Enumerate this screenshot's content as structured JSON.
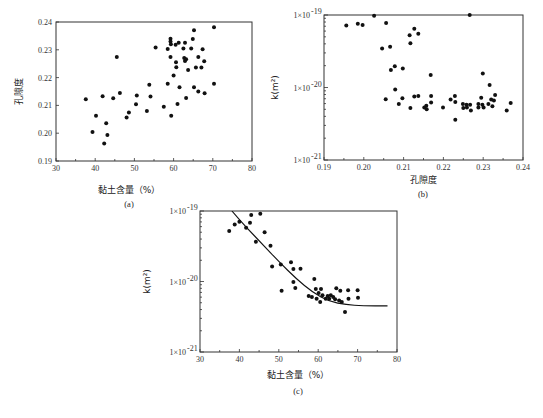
{
  "chart_data": [
    {
      "id": "a",
      "type": "scatter",
      "panel_label": "(a)",
      "title": "",
      "xlabel": "黏土含量（%）",
      "ylabel": "孔隙度",
      "xlim": [
        30,
        80
      ],
      "ylim": [
        0.19,
        0.24
      ],
      "yscale": "linear",
      "xticks": [
        30,
        40,
        50,
        60,
        70,
        80
      ],
      "xtick_labels": [
        "30",
        "40",
        "50",
        "60",
        "70",
        "80"
      ],
      "yticks": [
        0.19,
        0.2,
        0.21,
        0.22,
        0.23,
        0.24
      ],
      "ytick_labels": [
        "0.19",
        "0.20",
        "0.21",
        "0.22",
        "0.23",
        "0.24"
      ],
      "grid": false,
      "points": [
        [
          37.6,
          0.2122
        ],
        [
          39.3,
          0.2004
        ],
        [
          40.2,
          0.2063
        ],
        [
          41.9,
          0.2133
        ],
        [
          42.3,
          0.1963
        ],
        [
          42.8,
          0.2036
        ],
        [
          43.1,
          0.1994
        ],
        [
          44.6,
          0.2126
        ],
        [
          45.5,
          0.2274
        ],
        [
          46.3,
          0.2145
        ],
        [
          48.0,
          0.2057
        ],
        [
          48.6,
          0.2075
        ],
        [
          50.4,
          0.2104
        ],
        [
          50.6,
          0.2136
        ],
        [
          53.2,
          0.208
        ],
        [
          53.8,
          0.2174
        ],
        [
          54.1,
          0.2132
        ],
        [
          55.4,
          0.2308
        ],
        [
          57.5,
          0.2095
        ],
        [
          58.5,
          0.2178
        ],
        [
          58.5,
          0.2303
        ],
        [
          59.2,
          0.234
        ],
        [
          59.2,
          0.233
        ],
        [
          59.3,
          0.232
        ],
        [
          59.2,
          0.2274
        ],
        [
          59.4,
          0.2063
        ],
        [
          60.0,
          0.2208
        ],
        [
          60.5,
          0.2318
        ],
        [
          60.6,
          0.2255
        ],
        [
          60.7,
          0.2237
        ],
        [
          61.0,
          0.2105
        ],
        [
          61.3,
          0.2325
        ],
        [
          61.5,
          0.2165
        ],
        [
          62.5,
          0.2305
        ],
        [
          62.7,
          0.227
        ],
        [
          62.9,
          0.2325
        ],
        [
          62.9,
          0.226
        ],
        [
          63.2,
          0.2266
        ],
        [
          63.2,
          0.2127
        ],
        [
          63.7,
          0.2227
        ],
        [
          64.5,
          0.2305
        ],
        [
          64.9,
          0.2339
        ],
        [
          65.2,
          0.237
        ],
        [
          65.2,
          0.2165
        ],
        [
          65.7,
          0.2236
        ],
        [
          66.3,
          0.2274
        ],
        [
          66.3,
          0.215
        ],
        [
          67.1,
          0.2236
        ],
        [
          67.4,
          0.2302
        ],
        [
          67.8,
          0.2259
        ],
        [
          67.9,
          0.2144
        ],
        [
          70.3,
          0.2381
        ],
        [
          70.3,
          0.2178
        ]
      ]
    },
    {
      "id": "b",
      "type": "scatter",
      "panel_label": "(b)",
      "title": "",
      "xlabel": "孔隙度",
      "ylabel": "k(m²)",
      "xlim": [
        0.19,
        0.24
      ],
      "ylim": [
        1e-21,
        1e-19
      ],
      "yscale": "log",
      "xticks": [
        0.19,
        0.2,
        0.21,
        0.22,
        0.23,
        0.24
      ],
      "xtick_labels": [
        "0.19",
        "0.20",
        "0.21",
        "0.22",
        "0.23",
        "0.24"
      ],
      "yticks": [
        1e-21,
        1e-20,
        1e-19
      ],
      "ytick_labels": [
        [
          "1×10",
          "-21"
        ],
        [
          "1×10",
          "-20"
        ],
        [
          "1×10",
          "-19"
        ]
      ],
      "grid": false,
      "points": [
        [
          0.1956,
          7.16e-20
        ],
        [
          0.1985,
          7.59e-20
        ],
        [
          0.1997,
          7.25e-20
        ],
        [
          0.2026,
          9.77e-20
        ],
        [
          0.2056,
          7.77e-20
        ],
        [
          0.2046,
          3.44e-20
        ],
        [
          0.2066,
          3.64e-20
        ],
        [
          0.2068,
          1.75e-20
        ],
        [
          0.2078,
          1.96e-20
        ],
        [
          0.2098,
          1.83e-20
        ],
        [
          0.2055,
          6.9e-21
        ],
        [
          0.2079,
          9.4e-21
        ],
        [
          0.2088,
          5.9e-21
        ],
        [
          0.2097,
          7.1e-21
        ],
        [
          0.2115,
          5.26e-20
        ],
        [
          0.2117,
          4.09e-20
        ],
        [
          0.2127,
          6.46e-20
        ],
        [
          0.2137,
          5.51e-20
        ],
        [
          0.2117,
          5.2e-21
        ],
        [
          0.2127,
          7.5e-21
        ],
        [
          0.2137,
          7.6e-21
        ],
        [
          0.2152,
          5.3e-21
        ],
        [
          0.2157,
          5.6e-21
        ],
        [
          0.2158,
          5e-21
        ],
        [
          0.2168,
          1.49e-20
        ],
        [
          0.2169,
          7.6e-21
        ],
        [
          0.2169,
          6.2e-21
        ],
        [
          0.2199,
          5.3e-21
        ],
        [
          0.2218,
          6.8e-21
        ],
        [
          0.2229,
          7.6e-21
        ],
        [
          0.223,
          6.3e-21
        ],
        [
          0.223,
          3.6e-21
        ],
        [
          0.2249,
          5.9e-21
        ],
        [
          0.225,
          5.2e-21
        ],
        [
          0.2258,
          5.8e-21
        ],
        [
          0.2259,
          5.3e-21
        ],
        [
          0.2266,
          1e-19
        ],
        [
          0.2267,
          5.8e-21
        ],
        [
          0.2269,
          4.8e-21
        ],
        [
          0.2288,
          5.9e-21
        ],
        [
          0.2288,
          5.3e-21
        ],
        [
          0.2295,
          7.2e-21
        ],
        [
          0.2298,
          5.8e-21
        ],
        [
          0.2299,
          1.56e-20
        ],
        [
          0.2301,
          5.3e-21
        ],
        [
          0.2313,
          5.9e-21
        ],
        [
          0.2316,
          1.08e-20
        ],
        [
          0.232,
          6.8e-21
        ],
        [
          0.2323,
          5.5e-21
        ],
        [
          0.2327,
          6.6e-21
        ],
        [
          0.233,
          7.9e-21
        ],
        [
          0.2359,
          4.8e-21
        ],
        [
          0.2369,
          6.1e-21
        ]
      ]
    },
    {
      "id": "c",
      "type": "scatter",
      "panel_label": "(c)",
      "title": "",
      "xlabel": "黏土含量（%）",
      "ylabel": "k(m²)",
      "xlim": [
        30,
        80
      ],
      "ylim": [
        1e-21,
        1e-19
      ],
      "yscale": "log",
      "xticks": [
        30,
        40,
        50,
        60,
        70,
        80
      ],
      "xtick_labels": [
        "30",
        "40",
        "50",
        "60",
        "70",
        "80"
      ],
      "yticks": [
        1e-21,
        1e-20,
        1e-19
      ],
      "ytick_labels": [
        [
          "1×10",
          "-21"
        ],
        [
          "1×10",
          "-20"
        ],
        [
          "1×10",
          "-19"
        ]
      ],
      "grid": false,
      "points": [
        [
          37.4,
          5.22e-20
        ],
        [
          38.8,
          6.43e-20
        ],
        [
          40.0,
          7.03e-20
        ],
        [
          41.7,
          5.77e-20
        ],
        [
          42.7,
          6.8e-20
        ],
        [
          43.0,
          8.76e-20
        ],
        [
          44.2,
          3.67e-20
        ],
        [
          45.3,
          9.16e-20
        ],
        [
          46.4,
          4.99e-20
        ],
        [
          47.9,
          3.22e-20
        ],
        [
          48.3,
          1.64e-20
        ],
        [
          50.5,
          1.75e-20
        ],
        [
          50.7,
          7.4e-21
        ],
        [
          53.1,
          1.87e-20
        ],
        [
          53.7,
          1.51e-20
        ],
        [
          53.7,
          9.8e-21
        ],
        [
          54.2,
          8.1e-21
        ],
        [
          55.5,
          1.52e-20
        ],
        [
          57.6,
          6.2e-21
        ],
        [
          59.0,
          1.08e-20
        ],
        [
          58.4,
          6e-21
        ],
        [
          59.4,
          7.8e-21
        ],
        [
          59.6,
          5.7e-21
        ],
        [
          60.1,
          6.9e-21
        ],
        [
          60.5,
          5.1e-21
        ],
        [
          60.7,
          7.8e-21
        ],
        [
          61.1,
          6.4e-21
        ],
        [
          61.9,
          5.7e-21
        ],
        [
          62.4,
          6.2e-21
        ],
        [
          62.8,
          5.7e-21
        ],
        [
          63.2,
          6.4e-21
        ],
        [
          63.8,
          6e-21
        ],
        [
          64.3,
          5.6e-21
        ],
        [
          64.6,
          8e-21
        ],
        [
          65.3,
          5.4e-21
        ],
        [
          65.6,
          7.4e-21
        ],
        [
          66.0,
          5.1e-21
        ],
        [
          66.8,
          3.7e-21
        ],
        [
          67.6,
          7.5e-21
        ],
        [
          67.7,
          5.7e-21
        ],
        [
          70.0,
          7.5e-21
        ],
        [
          70.1,
          5.9e-21
        ]
      ],
      "fit_curve": [
        [
          38.1,
          1e-19
        ],
        [
          41.7,
          5.9e-20
        ],
        [
          46.0,
          3.3e-20
        ],
        [
          50.2,
          1.87e-20
        ],
        [
          54.4,
          1.1e-20
        ],
        [
          58.6,
          7e-21
        ],
        [
          62.8,
          5.2e-21
        ],
        [
          67.1,
          4.7e-21
        ],
        [
          71.3,
          4.5e-21
        ],
        [
          77.6,
          4.5e-21
        ]
      ]
    }
  ]
}
